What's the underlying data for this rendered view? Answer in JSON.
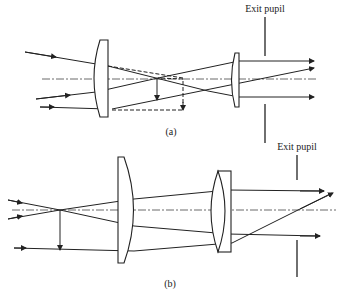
{
  "figure": {
    "panel_a": {
      "caption": "(a)",
      "exit_pupil_label": "Exit pupil"
    },
    "panel_b": {
      "caption": "(b)",
      "exit_pupil_label": "Exit pupil"
    }
  },
  "colors": {
    "ink": "#222222",
    "background": "#ffffff"
  }
}
